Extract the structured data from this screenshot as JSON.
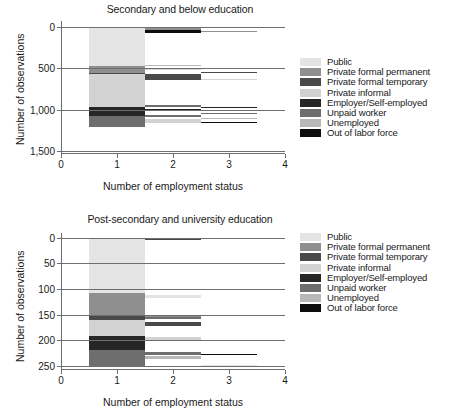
{
  "chart_data": [
    {
      "type": "bar",
      "id": "secondary-and-below",
      "title": "Secondary and below education",
      "xlabel": "Number of employment status",
      "ylabel": "Number of observations",
      "xticks": [
        "0",
        "1",
        "2",
        "3",
        "4"
      ],
      "xlim": [
        0,
        4
      ],
      "yticks": [
        "0",
        "500",
        "1,000",
        "1,500"
      ],
      "ylim": [
        0,
        1550
      ],
      "grid": true,
      "legend_position": "right",
      "categories": [
        "1",
        "2",
        "3"
      ],
      "series": [
        {
          "name": "Public",
          "color": "#e4e4e4",
          "values": [
            470,
            18,
            2
          ]
        },
        {
          "name": "Private formal permanent",
          "color": "#8f8f8f",
          "values": [
            88,
            20,
            6
          ]
        },
        {
          "name": "Private formal temporary",
          "color": "#4a4a4a",
          "values": [
            14,
            72,
            9
          ]
        },
        {
          "name": "Private informal",
          "color": "#d2d2d2",
          "values": [
            388,
            26,
            5
          ]
        },
        {
          "name": "Employer/Self-employed",
          "color": "#262626",
          "values": [
            112,
            30,
            7
          ]
        },
        {
          "name": "Unpaid worker",
          "color": "#6e6e6e",
          "values": [
            136,
            44,
            11
          ]
        },
        {
          "name": "Unemployed",
          "color": "#b8b8b8",
          "values": [
            0,
            22,
            6
          ]
        },
        {
          "name": "Out of labor force",
          "color": "#0d0d0d",
          "values": [
            0,
            38,
            4
          ]
        }
      ]
    },
    {
      "type": "bar",
      "id": "post-secondary-and-university",
      "title": "Post-secondary and university education",
      "xlabel": "Number of employment status",
      "ylabel": "Number of observations",
      "xticks": [
        "0",
        "1",
        "2",
        "3",
        "4"
      ],
      "xlim": [
        0,
        4
      ],
      "yticks": [
        "0",
        "50",
        "100",
        "150",
        "200",
        "250"
      ],
      "ylim": [
        0,
        255
      ],
      "grid": true,
      "legend_position": "right",
      "categories": [
        "1",
        "2",
        "3"
      ],
      "series": [
        {
          "name": "Public",
          "color": "#e4e4e4",
          "values": [
            118,
            3,
            0
          ]
        },
        {
          "name": "Private formal permanent",
          "color": "#8f8f8f",
          "values": [
            42,
            4,
            1
          ]
        },
        {
          "name": "Private formal temporary",
          "color": "#4a4a4a",
          "values": [
            9,
            9,
            1
          ]
        },
        {
          "name": "Private informal",
          "color": "#d2d2d2",
          "values": [
            31,
            12,
            2
          ]
        },
        {
          "name": "Employer/Self-employed",
          "color": "#262626",
          "values": [
            28,
            3,
            1
          ]
        },
        {
          "name": "Unpaid worker",
          "color": "#6e6e6e",
          "values": [
            22,
            7,
            3
          ]
        },
        {
          "name": "Unemployed",
          "color": "#b8b8b8",
          "values": [
            0,
            5,
            1
          ]
        },
        {
          "name": "Out of labor force",
          "color": "#0d0d0d",
          "values": [
            0,
            3,
            1
          ]
        }
      ]
    }
  ],
  "figures": {
    "top": {
      "title": "Secondary and below education",
      "xcaption": "Number of employment status",
      "ycaption": "Number of observations",
      "yticks": [
        {
          "label": "0",
          "pos": 4.2
        },
        {
          "label": "500",
          "pos": 35.5
        },
        {
          "label": "1,000",
          "pos": 66.8
        },
        {
          "label": "1,500",
          "pos": 98.1
        }
      ],
      "xticks": [
        {
          "label": "0",
          "pos": 0
        },
        {
          "label": "1",
          "pos": 25
        },
        {
          "label": "2",
          "pos": 50
        },
        {
          "label": "3",
          "pos": 75
        },
        {
          "label": "4",
          "pos": 100
        }
      ],
      "segments": [
        {
          "name": "Public",
          "color": "#e4e4e4",
          "x": 12.5,
          "w": 25.0,
          "y": 4.2,
          "h": 29.4
        },
        {
          "name": "Private formal permanent",
          "color": "#8f8f8f",
          "x": 12.5,
          "w": 25.0,
          "y": 33.6,
          "h": 5.5
        },
        {
          "name": "Private formal temporary",
          "color": "#4a4a4a",
          "x": 12.5,
          "w": 25.0,
          "y": 39.1,
          "h": 0.9
        },
        {
          "name": "Private informal",
          "color": "#d2d2d2",
          "x": 12.5,
          "w": 25.0,
          "y": 40.0,
          "h": 24.3
        },
        {
          "name": "Employer/Self-employed",
          "color": "#262626",
          "x": 12.5,
          "w": 25.0,
          "y": 64.3,
          "h": 7.0
        },
        {
          "name": "Unpaid worker",
          "color": "#6e6e6e",
          "x": 12.5,
          "w": 25.0,
          "y": 71.3,
          "h": 8.5
        },
        {
          "name": "Public",
          "color": "#e4e4e4",
          "x": 37.5,
          "w": 25.0,
          "y": 4.2,
          "h": 1.1
        },
        {
          "name": "Private formal permanent",
          "color": "#8f8f8f",
          "x": 37.5,
          "w": 25.0,
          "y": 5.3,
          "h": 1.3
        },
        {
          "name": "Out of labor force",
          "color": "#0d0d0d",
          "x": 37.5,
          "w": 25.0,
          "y": 6.6,
          "h": 2.4
        },
        {
          "name": "Unemployed",
          "color": "#b8b8b8",
          "x": 37.5,
          "w": 25.0,
          "y": 33.0,
          "h": 0.6
        },
        {
          "name": "Private informal",
          "color": "#d2d2d2",
          "x": 37.5,
          "w": 25.0,
          "y": 35.6,
          "h": 1.6
        },
        {
          "name": "Private formal temporary",
          "color": "#4a4a4a",
          "x": 37.5,
          "w": 25.0,
          "y": 40.2,
          "h": 4.5
        },
        {
          "name": "Unpaid worker",
          "color": "#6e6e6e",
          "x": 37.5,
          "w": 25.0,
          "y": 63.2,
          "h": 1.1
        },
        {
          "name": "Employer/Self-employed",
          "color": "#262626",
          "x": 37.5,
          "w": 25.0,
          "y": 66.0,
          "h": 1.9
        },
        {
          "name": "Unpaid worker",
          "color": "#6e6e6e",
          "x": 37.5,
          "w": 25.0,
          "y": 70.5,
          "h": 2.0
        },
        {
          "name": "Private informal",
          "color": "#d2d2d2",
          "x": 37.5,
          "w": 25.0,
          "y": 74.0,
          "h": 2.7
        },
        {
          "name": "Public",
          "color": "#e4e4e4",
          "x": 62.5,
          "w": 25.0,
          "y": 4.2,
          "h": 0.4
        },
        {
          "name": "Private formal permanent",
          "color": "#8f8f8f",
          "x": 62.5,
          "w": 25.0,
          "y": 7.4,
          "h": 0.7
        },
        {
          "name": "Private formal temporary",
          "color": "#4a4a4a",
          "x": 62.5,
          "w": 25.0,
          "y": 38.0,
          "h": 0.7
        },
        {
          "name": "Private informal",
          "color": "#d2d2d2",
          "x": 62.5,
          "w": 25.0,
          "y": 43.5,
          "h": 0.8
        },
        {
          "name": "Employer/Self-employed",
          "color": "#262626",
          "x": 62.5,
          "w": 25.0,
          "y": 64.7,
          "h": 0.5
        },
        {
          "name": "Unpaid worker",
          "color": "#6e6e6e",
          "x": 62.5,
          "w": 25.0,
          "y": 69.3,
          "h": 0.8
        },
        {
          "name": "Unemployed",
          "color": "#b8b8b8",
          "x": 62.5,
          "w": 25.0,
          "y": 72.8,
          "h": 0.8
        },
        {
          "name": "Out of labor force",
          "color": "#0d0d0d",
          "x": 62.5,
          "w": 25.0,
          "y": 76.3,
          "h": 0.7
        },
        {
          "name": "Public",
          "color": "#e4e4e4",
          "x": 87.5,
          "w": 12.5,
          "y": 4.2,
          "h": 0.3
        }
      ]
    },
    "bottom": {
      "title": "Post-secondary and university education",
      "xcaption": "Number of employment status",
      "ycaption": "Number of observations",
      "yticks": [
        {
          "label": "0",
          "pos": 3.5
        },
        {
          "label": "50",
          "pos": 22.2
        },
        {
          "label": "100",
          "pos": 40.9
        },
        {
          "label": "150",
          "pos": 59.6
        },
        {
          "label": "200",
          "pos": 78.3
        },
        {
          "label": "250",
          "pos": 97.0
        }
      ],
      "xticks": [
        {
          "label": "0",
          "pos": 0
        },
        {
          "label": "1",
          "pos": 25
        },
        {
          "label": "2",
          "pos": 50
        },
        {
          "label": "3",
          "pos": 75
        },
        {
          "label": "4",
          "pos": 100
        }
      ],
      "segments": [
        {
          "name": "Public",
          "color": "#e4e4e4",
          "x": 12.5,
          "w": 25.0,
          "y": 3.5,
          "h": 40.5
        },
        {
          "name": "Private formal permanent",
          "color": "#8f8f8f",
          "x": 12.5,
          "w": 25.0,
          "y": 44.0,
          "h": 15.8
        },
        {
          "name": "Private formal temporary",
          "color": "#4a4a4a",
          "x": 12.5,
          "w": 25.0,
          "y": 59.8,
          "h": 3.5
        },
        {
          "name": "Private informal",
          "color": "#d2d2d2",
          "x": 12.5,
          "w": 25.0,
          "y": 63.3,
          "h": 11.8
        },
        {
          "name": "Employer/Self-employed",
          "color": "#262626",
          "x": 12.5,
          "w": 25.0,
          "y": 75.1,
          "h": 10.5
        },
        {
          "name": "Unpaid worker",
          "color": "#6e6e6e",
          "x": 12.5,
          "w": 25.0,
          "y": 85.6,
          "h": 11.4
        },
        {
          "name": "Private formal temporary",
          "color": "#4a4a4a",
          "x": 37.5,
          "w": 25.0,
          "y": 3.5,
          "h": 1.8
        },
        {
          "name": "Public",
          "color": "#e4e4e4",
          "x": 37.5,
          "w": 25.0,
          "y": 45.2,
          "h": 2.2
        },
        {
          "name": "Private formal permanent",
          "color": "#8f8f8f",
          "x": 37.5,
          "w": 25.0,
          "y": 59.8,
          "h": 1.2
        },
        {
          "name": "Unpaid worker",
          "color": "#6e6e6e",
          "x": 37.5,
          "w": 25.0,
          "y": 61.5,
          "h": 1.0
        },
        {
          "name": "Private formal temporary",
          "color": "#4a4a4a",
          "x": 37.5,
          "w": 25.0,
          "y": 64.6,
          "h": 3.3
        },
        {
          "name": "Private informal",
          "color": "#d2d2d2",
          "x": 37.5,
          "w": 25.0,
          "y": 76.0,
          "h": 2.3
        },
        {
          "name": "Unpaid worker",
          "color": "#6e6e6e",
          "x": 37.5,
          "w": 25.0,
          "y": 86.6,
          "h": 2.2
        },
        {
          "name": "Unemployed",
          "color": "#b8b8b8",
          "x": 37.5,
          "w": 25.0,
          "y": 90.0,
          "h": 2.0
        },
        {
          "name": "Out of labor force",
          "color": "#0d0d0d",
          "x": 62.5,
          "w": 25.0,
          "y": 88.2,
          "h": 0.8
        },
        {
          "name": "Public",
          "color": "#e4e4e4",
          "x": 62.5,
          "w": 25.0,
          "y": 96.2,
          "h": 0.5
        }
      ]
    }
  },
  "legend": {
    "items": [
      {
        "label": "Public",
        "color": "#e4e4e4"
      },
      {
        "label": "Private formal permanent",
        "color": "#8f8f8f"
      },
      {
        "label": "Private formal temporary",
        "color": "#4a4a4a"
      },
      {
        "label": "Private informal",
        "color": "#d2d2d2"
      },
      {
        "label": "Employer/Self-employed",
        "color": "#262626"
      },
      {
        "label": "Unpaid worker",
        "color": "#6e6e6e"
      },
      {
        "label": "Unemployed",
        "color": "#b8b8b8"
      },
      {
        "label": "Out of labor force",
        "color": "#0d0d0d"
      }
    ]
  }
}
